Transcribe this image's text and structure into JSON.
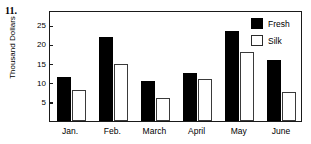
{
  "problem": {
    "number": "11."
  },
  "chart_data": {
    "type": "bar",
    "title": "",
    "xlabel": "",
    "ylabel": "Thousand Dollars",
    "categories": [
      "Jan.",
      "Feb.",
      "March",
      "April",
      "May",
      "June"
    ],
    "series": [
      {
        "name": "Fresh",
        "color": "#000000",
        "values": [
          11.5,
          22,
          10.5,
          12.5,
          23.5,
          16
        ]
      },
      {
        "name": "Silk",
        "color": "#ffffff",
        "values": [
          8,
          15,
          6,
          11,
          18,
          7.5
        ]
      }
    ],
    "ylim": [
      0,
      29
    ],
    "yticks": [
      5,
      10,
      15,
      20,
      25
    ],
    "ytick_labels": [
      "5",
      "10",
      "15",
      "20",
      "25"
    ],
    "grid": false,
    "legend_position": "top-right",
    "legend_entries": [
      "Fresh",
      "Silk"
    ]
  }
}
